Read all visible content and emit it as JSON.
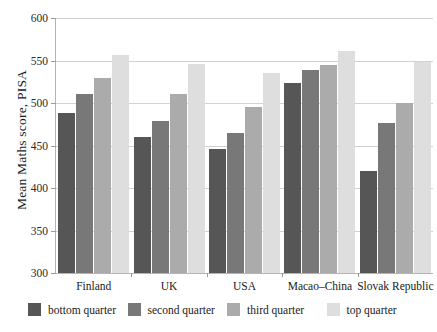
{
  "chart_data": {
    "type": "bar",
    "title": "",
    "xlabel": "",
    "ylabel": "Mean Maths score, PISA",
    "ylim": [
      300,
      600
    ],
    "yticks": [
      300,
      350,
      400,
      450,
      500,
      550,
      600
    ],
    "grid": true,
    "legend_position": "bottom",
    "categories": [
      "Finland",
      "UK",
      "USA",
      "Macao–China",
      "Slovak Republic"
    ],
    "series": [
      {
        "name": "bottom quarter",
        "color": "#565656",
        "values": [
          488,
          459,
          445,
          523,
          420
        ]
      },
      {
        "name": "second quarter",
        "color": "#787878",
        "values": [
          510,
          478,
          464,
          538,
          476
        ]
      },
      {
        "name": "third quarter",
        "color": "#ababab",
        "values": [
          529,
          510,
          494,
          544,
          499
        ]
      },
      {
        "name": "top quarter",
        "color": "#dedede",
        "values": [
          556,
          545,
          534,
          560,
          547
        ]
      }
    ]
  },
  "axis": {
    "y_label": "Mean Maths score, PISA",
    "y_ticks": [
      "600",
      "550",
      "500",
      "450",
      "400",
      "350",
      "300"
    ],
    "x_ticks": [
      "Finland",
      "UK",
      "USA",
      "Macao–China",
      "Slovak Republic"
    ]
  },
  "legend": {
    "items": [
      {
        "label": "bottom quarter",
        "color": "#565656"
      },
      {
        "label": "second quarter",
        "color": "#787878"
      },
      {
        "label": "third quarter",
        "color": "#ababab"
      },
      {
        "label": "top quarter",
        "color": "#dedede"
      }
    ]
  },
  "caption": {
    "text": ""
  }
}
